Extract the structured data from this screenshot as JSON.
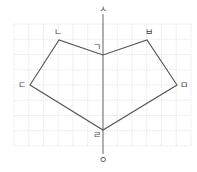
{
  "diagram": {
    "grid": {
      "x0": 14,
      "y0": 24,
      "x1": 191,
      "y1": 146,
      "step": 14.75
    },
    "axis": {
      "x": 103,
      "y_top": 14,
      "y_bottom": 154,
      "top_label": "ㅅ",
      "bottom_label": "ㅇ"
    },
    "polygon_points": [
      {
        "label": "ㄱ",
        "x": 103,
        "y": 55,
        "lx": 97,
        "ly": 47
      },
      {
        "label": "ㄴ",
        "x": 59,
        "y": 40,
        "lx": 58,
        "ly": 32
      },
      {
        "label": "ㄷ",
        "x": 30,
        "y": 85,
        "lx": 22,
        "ly": 85
      },
      {
        "label": "ㄹ",
        "x": 103,
        "y": 130,
        "lx": 97,
        "ly": 135
      },
      {
        "label": "ㅁ",
        "x": 177,
        "y": 85,
        "lx": 184,
        "ly": 85
      },
      {
        "label": "ㅂ",
        "x": 147,
        "y": 40,
        "lx": 149,
        "ly": 32
      }
    ],
    "order": [
      "ㄱ",
      "ㄴ",
      "ㄷ",
      "ㄹ",
      "ㅁ",
      "ㅂ"
    ],
    "colors": {
      "grid": "#d8d8d8",
      "line": "#555555",
      "axis": "#666666"
    }
  }
}
